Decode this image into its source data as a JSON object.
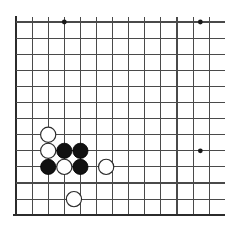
{
  "board": {
    "title": "Go board position",
    "background_color": "#ffffff",
    "line_color": "#4a4a4a",
    "edge_color": "#2b2b2b",
    "black_stone_color": "#111111",
    "white_stone_color": "#ffffff",
    "geometry": {
      "origin_x": 16,
      "origin_y": 22,
      "spacing_x": 16.1,
      "spacing_y": 16.1,
      "columns": 13,
      "rows": 13,
      "stone_radius": 7.6,
      "star_radius": 2.4,
      "left_edge_x": 16,
      "top_edge_y": 22,
      "bottom_edge_y": 215,
      "right_clip_x": 225
    },
    "edges": [
      {
        "name": "left-border",
        "orientation": "vertical",
        "index": 0
      },
      {
        "name": "bottom-border",
        "orientation": "horizontal",
        "index": 12
      }
    ],
    "star_points": [
      {
        "name": "star-point-top-left",
        "col": 3,
        "row": 0
      },
      {
        "name": "star-point-top-right",
        "col": 11.45,
        "row": 0
      },
      {
        "name": "star-point-right",
        "col": 11.45,
        "row": 8
      }
    ],
    "stones": [
      {
        "name": "white-stone-c2r7",
        "color": "white",
        "col": 2,
        "row": 7
      },
      {
        "name": "white-stone-c2r8",
        "color": "white",
        "col": 2,
        "row": 8
      },
      {
        "name": "black-stone-c3r8",
        "color": "black",
        "col": 3,
        "row": 8
      },
      {
        "name": "black-stone-c4r8",
        "color": "black",
        "col": 4,
        "row": 8
      },
      {
        "name": "black-stone-c2r9",
        "color": "black",
        "col": 2,
        "row": 9
      },
      {
        "name": "white-stone-c3r9",
        "color": "white",
        "col": 3,
        "row": 9
      },
      {
        "name": "black-stone-c4r9",
        "color": "black",
        "col": 4,
        "row": 9
      },
      {
        "name": "white-stone-c5r9",
        "color": "white",
        "col": 5.6,
        "row": 9
      },
      {
        "name": "white-stone-c3r11",
        "color": "white",
        "col": 3.6,
        "row": 11
      }
    ]
  }
}
